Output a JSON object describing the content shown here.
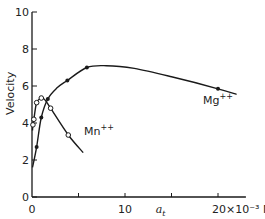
{
  "chart_data": {
    "type": "line",
    "title": "",
    "xlabel": "a_t",
    "xlabel_display": "a",
    "xlabel_subscript": "t",
    "x_unit_label": "20×10⁻³ M",
    "ylabel": "Velocity",
    "xlim": [
      0,
      23
    ],
    "ylim": [
      0,
      10
    ],
    "x_ticks": [
      0,
      5,
      10,
      15,
      20
    ],
    "x_tick_labels": [
      "0",
      "",
      "10",
      "",
      "20×10⁻³ M"
    ],
    "y_ticks": [
      0,
      2,
      4,
      6,
      8,
      10
    ],
    "y_tick_labels": [
      "0",
      "2",
      "4",
      "6",
      "8",
      "10"
    ],
    "grid": false,
    "legend": "inline labels",
    "series": [
      {
        "name": "Mg++",
        "label": "Mg",
        "label_sup": "++",
        "marker": "filled-circle",
        "points": [
          {
            "x": 0.5,
            "y": 2.7
          },
          {
            "x": 1.0,
            "y": 4.3
          },
          {
            "x": 1.7,
            "y": 5.3
          },
          {
            "x": 3.8,
            "y": 6.3
          },
          {
            "x": 5.9,
            "y": 7.0
          },
          {
            "x": 20.0,
            "y": 5.85
          }
        ],
        "curve": [
          {
            "x": 0.05,
            "y": 1.6
          },
          {
            "x": 0.5,
            "y": 2.7
          },
          {
            "x": 1.0,
            "y": 4.3
          },
          {
            "x": 1.7,
            "y": 5.3
          },
          {
            "x": 2.7,
            "y": 5.9
          },
          {
            "x": 3.8,
            "y": 6.3
          },
          {
            "x": 5.9,
            "y": 7.0
          },
          {
            "x": 8.0,
            "y": 7.1
          },
          {
            "x": 11.0,
            "y": 6.95
          },
          {
            "x": 15.0,
            "y": 6.5
          },
          {
            "x": 20.0,
            "y": 5.85
          },
          {
            "x": 22.0,
            "y": 5.55
          }
        ]
      },
      {
        "name": "Mn++",
        "label": "Mn",
        "label_sup": "++",
        "marker": "open-circle",
        "points": [
          {
            "x": 0.1,
            "y": 3.9
          },
          {
            "x": 0.2,
            "y": 4.2
          },
          {
            "x": 0.5,
            "y": 5.1
          },
          {
            "x": 1.0,
            "y": 5.35
          },
          {
            "x": 2.0,
            "y": 4.8
          },
          {
            "x": 3.9,
            "y": 3.35
          }
        ],
        "curve": [
          {
            "x": 0.05,
            "y": 3.6
          },
          {
            "x": 0.1,
            "y": 3.9
          },
          {
            "x": 0.2,
            "y": 4.2
          },
          {
            "x": 0.5,
            "y": 5.1
          },
          {
            "x": 1.0,
            "y": 5.35
          },
          {
            "x": 1.4,
            "y": 5.25
          },
          {
            "x": 2.0,
            "y": 4.8
          },
          {
            "x": 3.9,
            "y": 3.35
          },
          {
            "x": 5.5,
            "y": 2.4
          }
        ]
      }
    ]
  }
}
